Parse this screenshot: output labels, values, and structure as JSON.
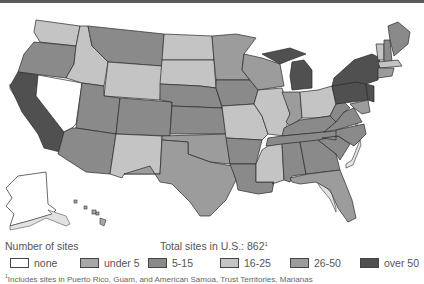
{
  "legend": {
    "title": "Number of sites",
    "total_label": "Total sites in U.S.:",
    "total_value": "862",
    "total_footnote_mark": "1",
    "items": [
      {
        "label": "none",
        "color": "#ffffff"
      },
      {
        "label": "under 5",
        "color": "#a8a8a8"
      },
      {
        "label": "5-15",
        "color": "#8a8a8a"
      },
      {
        "label": "16-25",
        "color": "#c4c4c4"
      },
      {
        "label": "26-50",
        "color": "#9c9c9c"
      },
      {
        "label": "over 50",
        "color": "#505050"
      }
    ]
  },
  "footnote": {
    "mark": "1",
    "text": "Includes sites in Puerto Rico, Guam, and American Samoa, Trust Territories, Marianas"
  },
  "map": {
    "states": [
      {
        "name": "Washington",
        "category": "16-25"
      },
      {
        "name": "Oregon",
        "category": "5-15"
      },
      {
        "name": "California",
        "category": "over 50"
      },
      {
        "name": "Nevada",
        "category": "none"
      },
      {
        "name": "Idaho",
        "category": "16-25"
      },
      {
        "name": "Montana",
        "category": "5-15"
      },
      {
        "name": "Wyoming",
        "category": "16-25"
      },
      {
        "name": "Utah",
        "category": "5-15"
      },
      {
        "name": "Arizona",
        "category": "5-15"
      },
      {
        "name": "Colorado",
        "category": "5-15"
      },
      {
        "name": "New Mexico",
        "category": "16-25"
      },
      {
        "name": "North Dakota",
        "category": "16-25"
      },
      {
        "name": "South Dakota",
        "category": "16-25"
      },
      {
        "name": "Nebraska",
        "category": "5-15"
      },
      {
        "name": "Kansas",
        "category": "5-15"
      },
      {
        "name": "Oklahoma",
        "category": "26-50"
      },
      {
        "name": "Texas",
        "category": "26-50"
      },
      {
        "name": "Minnesota",
        "category": "26-50"
      },
      {
        "name": "Iowa",
        "category": "5-15"
      },
      {
        "name": "Missouri",
        "category": "16-25"
      },
      {
        "name": "Arkansas",
        "category": "5-15"
      },
      {
        "name": "Louisiana",
        "category": "5-15"
      },
      {
        "name": "Wisconsin",
        "category": "26-50"
      },
      {
        "name": "Illinois",
        "category": "16-25"
      },
      {
        "name": "Michigan",
        "category": "over 50"
      },
      {
        "name": "Indiana",
        "category": "26-50"
      },
      {
        "name": "Ohio",
        "category": "16-25"
      },
      {
        "name": "Kentucky",
        "category": "5-15"
      },
      {
        "name": "Tennessee",
        "category": "5-15"
      },
      {
        "name": "Mississippi",
        "category": "16-25"
      },
      {
        "name": "Alabama",
        "category": "5-15"
      },
      {
        "name": "Georgia",
        "category": "5-15"
      },
      {
        "name": "Florida",
        "category": "26-50"
      },
      {
        "name": "South Carolina",
        "category": "5-15"
      },
      {
        "name": "North Carolina",
        "category": "5-15"
      },
      {
        "name": "Virginia",
        "category": "5-15"
      },
      {
        "name": "West Virginia",
        "category": "5-15"
      },
      {
        "name": "Pennsylvania",
        "category": "over 50"
      },
      {
        "name": "New York",
        "category": "over 50"
      },
      {
        "name": "New Jersey",
        "category": "over 50"
      },
      {
        "name": "Vermont",
        "category": "16-25"
      },
      {
        "name": "New Hampshire",
        "category": "5-15"
      },
      {
        "name": "Maine",
        "category": "5-15"
      },
      {
        "name": "Massachusetts",
        "category": "16-25"
      },
      {
        "name": "Alaska",
        "category": "none"
      },
      {
        "name": "Hawaii",
        "category": "under 5"
      }
    ]
  }
}
